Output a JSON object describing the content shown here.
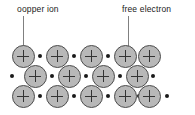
{
  "diagram": {
    "width": 195,
    "height": 115,
    "background_color": "#ffffff"
  },
  "labels": [
    {
      "id": "copper-ion",
      "text": "oopper ion",
      "x": 17,
      "y": 4,
      "leader": {
        "x": 23,
        "y": 16,
        "height": 34,
        "color": "#808080"
      }
    },
    {
      "id": "free-electron",
      "text": "free electron",
      "x": 122,
      "y": 4,
      "leader": {
        "x": 128,
        "y": 16,
        "height": 37,
        "color": "#808080"
      }
    }
  ],
  "legend_colors": {
    "ion_fill": "#b8b8b8",
    "ion_stroke": "#4d4d4d",
    "plus_sign": "#333333",
    "electron": "#1a1a1a",
    "leader_line": "#808080",
    "text": "#1a1a1a"
  },
  "lattice": {
    "ion_symbol": "+",
    "ion_diameter": 23,
    "electron_diameter": 4.5,
    "rows": [
      {
        "row_index": 1,
        "y": 56,
        "ions": [
          {
            "name": "copper-ion",
            "x": 23
          },
          {
            "name": "copper-ion",
            "x": 57
          },
          {
            "name": "copper-ion",
            "x": 91
          },
          {
            "name": "copper-ion",
            "x": 125
          },
          {
            "name": "copper-ion",
            "x": 149
          }
        ],
        "electrons": [
          {
            "name": "free-electron",
            "x": 40
          },
          {
            "name": "free-electron",
            "x": 74
          },
          {
            "name": "free-electron",
            "x": 108
          },
          {
            "name": "free-electron",
            "x": 128
          }
        ]
      },
      {
        "row_index": 2,
        "y": 76,
        "ions": [
          {
            "name": "copper-ion",
            "x": 35
          },
          {
            "name": "copper-ion",
            "x": 69
          },
          {
            "name": "copper-ion",
            "x": 103
          },
          {
            "name": "copper-ion",
            "x": 137
          }
        ],
        "electrons": [
          {
            "name": "free-electron",
            "x": 12
          },
          {
            "name": "free-electron",
            "x": 52
          },
          {
            "name": "free-electron",
            "x": 86
          },
          {
            "name": "free-electron",
            "x": 120
          },
          {
            "name": "free-electron",
            "x": 153
          }
        ]
      },
      {
        "row_index": 3,
        "y": 96,
        "ions": [
          {
            "name": "copper-ion",
            "x": 23
          },
          {
            "name": "copper-ion",
            "x": 57
          },
          {
            "name": "copper-ion",
            "x": 91
          },
          {
            "name": "copper-ion",
            "x": 125
          },
          {
            "name": "copper-ion",
            "x": 149
          }
        ],
        "electrons": [
          {
            "name": "free-electron",
            "x": 40
          },
          {
            "name": "free-electron",
            "x": 74
          },
          {
            "name": "free-electron",
            "x": 108
          },
          {
            "name": "free-electron",
            "x": 139
          },
          {
            "name": "free-electron",
            "x": 167
          }
        ]
      }
    ]
  }
}
